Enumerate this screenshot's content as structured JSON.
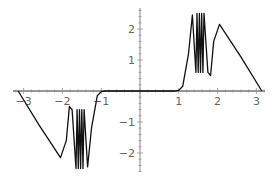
{
  "chart_data": {
    "type": "line",
    "title": "",
    "xlabel": "",
    "ylabel": "",
    "xlim": [
      -3.3,
      3.2
    ],
    "ylim": [
      -2.7,
      2.7
    ],
    "grid": false,
    "legend": null,
    "x_ticks": [
      -3,
      -2,
      -1,
      1,
      2,
      3
    ],
    "x_tick_labels": [
      "-3",
      "-2",
      "-1",
      "1",
      "2",
      "3"
    ],
    "y_ticks": [
      2,
      1,
      -1,
      -2
    ],
    "y_tick_labels": [
      "2",
      "1",
      "-1",
      "-2"
    ],
    "series": [
      {
        "name": "f(x)",
        "note": "odd function; near zero for |x|<1, rapid oscillation between ~0.6 and ~2.5 near |x|~1.45-1.65, linear descent to 0 at |x|=pi",
        "x": [
          -3.14,
          -2.6,
          -2.05,
          -1.9,
          -1.82,
          -1.75,
          -1.65,
          -1.62,
          -1.59,
          -1.56,
          -1.53,
          -1.5,
          -1.47,
          -1.44,
          -1.35,
          -1.25,
          -1.1,
          -1.0,
          -0.9,
          0,
          0.9,
          1.0,
          1.1,
          1.25,
          1.35,
          1.44,
          1.47,
          1.5,
          1.53,
          1.56,
          1.59,
          1.62,
          1.65,
          1.75,
          1.82,
          1.9,
          2.05,
          2.6,
          3.14
        ],
        "y": [
          0,
          -1.1,
          -2.15,
          -1.6,
          -0.5,
          -0.6,
          -2.5,
          -0.6,
          -2.5,
          -0.6,
          -2.5,
          -0.6,
          -2.5,
          -0.6,
          -2.45,
          -1.2,
          -0.15,
          -0.02,
          0,
          0,
          0,
          0.02,
          0.15,
          1.2,
          2.45,
          0.6,
          2.5,
          0.6,
          2.5,
          0.6,
          2.5,
          0.6,
          2.5,
          0.6,
          0.5,
          1.6,
          2.15,
          1.1,
          0
        ]
      }
    ],
    "colors": {
      "curve": "#111111",
      "axis": "#888888",
      "tick_label": "#666666"
    }
  }
}
